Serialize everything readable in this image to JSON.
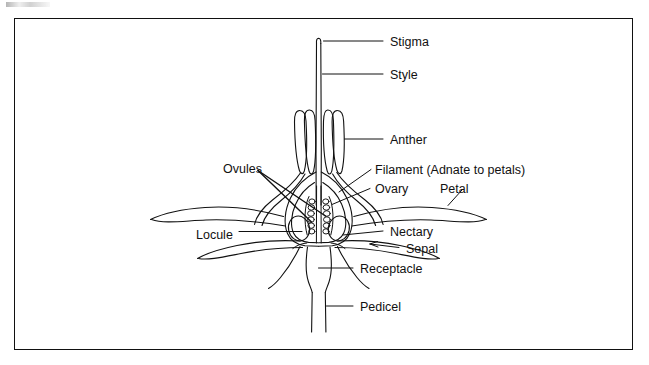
{
  "figure": {
    "type": "botanical-diagram",
    "frame": {
      "border_color": "#111111",
      "background": "#ffffff"
    },
    "line_color": "#111111"
  },
  "labels": [
    {
      "id": "stigma",
      "text": "Stigma",
      "x": 390,
      "y": 36,
      "leader": "horizontal"
    },
    {
      "id": "style",
      "text": "Style",
      "x": 390,
      "y": 69,
      "leader": "horizontal"
    },
    {
      "id": "anther",
      "text": "Anther",
      "x": 390,
      "y": 134,
      "leader": "horizontal"
    },
    {
      "id": "filament",
      "text": "Filament (Adnate to petals)",
      "x": 375,
      "y": 164,
      "leader": "diagonal"
    },
    {
      "id": "ovary",
      "text": "Ovary",
      "x": 375,
      "y": 183,
      "leader": "diagonal"
    },
    {
      "id": "petal",
      "text": "Petal",
      "x": 440,
      "y": 183,
      "leader": "diagonal"
    },
    {
      "id": "ovules",
      "text": "Ovules",
      "x": 223,
      "y": 163,
      "leader": "double-pointer"
    },
    {
      "id": "locule",
      "text": "Locule",
      "x": 196,
      "y": 229,
      "leader": "horizontal"
    },
    {
      "id": "nectary",
      "text": "Nectary",
      "x": 390,
      "y": 226,
      "leader": "horizontal"
    },
    {
      "id": "sepal",
      "text": "Sepal",
      "x": 406,
      "y": 243,
      "leader": "arrow"
    },
    {
      "id": "receptacle",
      "text": "Receptacle",
      "x": 360,
      "y": 263,
      "leader": "horizontal"
    },
    {
      "id": "pedicel",
      "text": "Pedicel",
      "x": 360,
      "y": 301,
      "leader": "horizontal"
    }
  ],
  "parts": {
    "stigma": "stigma-tip",
    "style": "style-column",
    "anthers": "anther-lobes",
    "filaments": "filament-strands",
    "ovary": "ovary-wall",
    "ovules": "ovule-rows",
    "locules": "locule-cavities",
    "petals": "petal-pair",
    "sepals": "sepal-pair",
    "nectary": "nectary-ring",
    "receptacle": "receptacle-base",
    "pedicel": "pedicel-stalk"
  }
}
